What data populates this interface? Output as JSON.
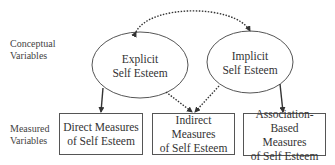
{
  "row_labels": {
    "conceptual": [
      "Conceptual",
      "Variables"
    ],
    "measured": [
      "Measured",
      "Variables"
    ]
  },
  "conceptual_nodes": [
    {
      "id": "explicit",
      "lines": [
        "Explicit",
        "Self Esteem"
      ]
    },
    {
      "id": "implicit",
      "lines": [
        "Implicit",
        "Self Esteem"
      ]
    }
  ],
  "measured_nodes": [
    {
      "id": "direct",
      "lines": [
        "Direct Measures",
        "of Self Esteem"
      ]
    },
    {
      "id": "indirect",
      "lines": [
        "Indirect Measures",
        "of Self Esteem"
      ]
    },
    {
      "id": "association",
      "lines": [
        "Association-Based",
        "Measures",
        "of Self Esteem"
      ]
    }
  ],
  "edges": [
    {
      "from": "explicit",
      "to": "implicit",
      "style": "dotted",
      "direction": "bidirectional",
      "shape": "curved"
    },
    {
      "from": "explicit",
      "to": "direct",
      "style": "solid",
      "direction": "forward"
    },
    {
      "from": "explicit",
      "to": "indirect",
      "style": "dotted",
      "direction": "forward"
    },
    {
      "from": "implicit",
      "to": "indirect",
      "style": "dotted",
      "direction": "forward"
    },
    {
      "from": "implicit",
      "to": "association",
      "style": "solid",
      "direction": "forward"
    }
  ],
  "colors": {
    "line": "#333333",
    "text": "#333333",
    "background": "#ffffff"
  }
}
